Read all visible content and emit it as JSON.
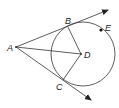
{
  "diagram": {
    "type": "geometry",
    "stroke_color": "#333333",
    "points": {
      "A": {
        "label": "A",
        "x": 16,
        "y": 47
      },
      "B": {
        "label": "B",
        "x": 68,
        "y": 27
      },
      "C": {
        "label": "C",
        "x": 63,
        "y": 80
      },
      "D": {
        "label": "D",
        "x": 81,
        "y": 54
      },
      "E": {
        "label": "E",
        "x": 101,
        "y": 30
      }
    },
    "circle": {
      "center": "D",
      "cx": 83,
      "cy": 54,
      "r": 32
    },
    "segments": [
      "AD",
      "DB",
      "DC"
    ],
    "rays": [
      "AB",
      "AC"
    ]
  }
}
